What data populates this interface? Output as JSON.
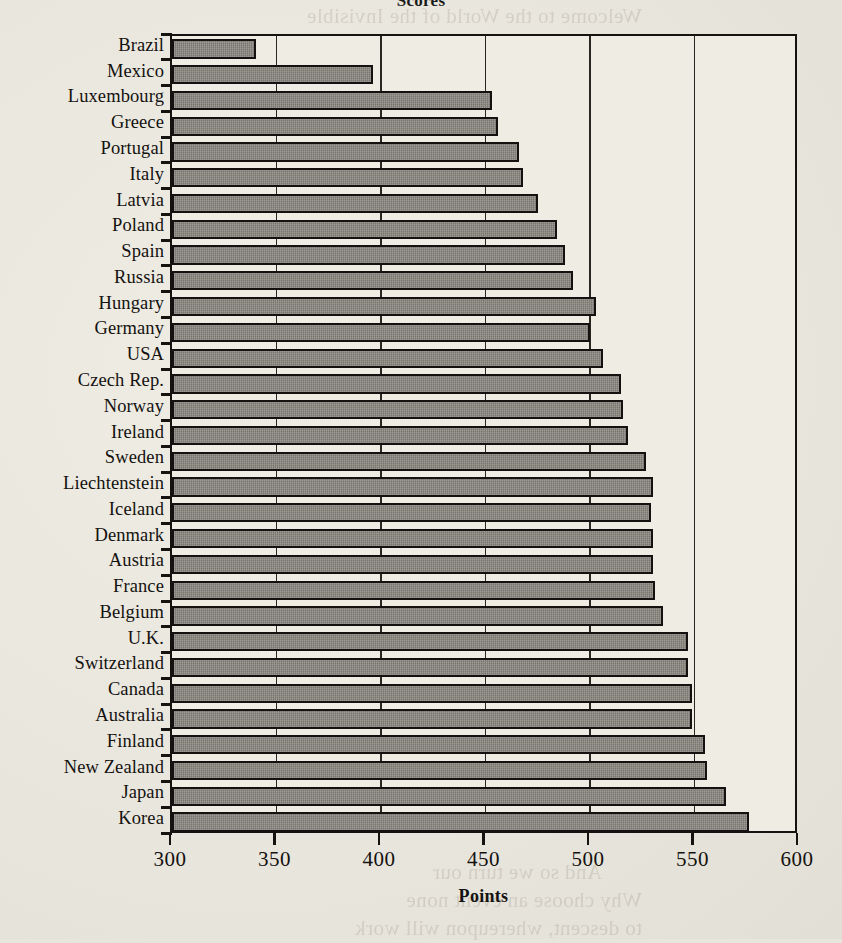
{
  "chart_data": {
    "type": "bar",
    "orientation": "horizontal",
    "title": "Scores",
    "xlabel": "Points",
    "ylabel": "",
    "xlim": [
      300,
      600
    ],
    "xticks": [
      300,
      350,
      400,
      450,
      500,
      550,
      600
    ],
    "grid": true,
    "grid_axis": "x",
    "legend": null,
    "bar_color": "#8a8780",
    "bar_edge_color": "#141210",
    "background_color": "#efece4",
    "categories": [
      "Brazil",
      "Mexico",
      "Luxembourg",
      "Greece",
      "Portugal",
      "Italy",
      "Latvia",
      "Poland",
      "Spain",
      "Russia",
      "Hungary",
      "Germany",
      "USA",
      "Czech Rep.",
      "Norway",
      "Ireland",
      "Sweden",
      "Liechtenstein",
      "Iceland",
      "Denmark",
      "Austria",
      "France",
      "Belgium",
      "U.K.",
      "Switzerland",
      "Canada",
      "Australia",
      "Finland",
      "New Zealand",
      "Japan",
      "Korea"
    ],
    "values": [
      340,
      396,
      453,
      456,
      466,
      468,
      475,
      484,
      488,
      492,
      503,
      500,
      506,
      515,
      516,
      518,
      527,
      530,
      529,
      530,
      530,
      531,
      535,
      547,
      547,
      549,
      549,
      555,
      556,
      565,
      576
    ],
    "series": [
      {
        "name": "Scores",
        "values": [
          340,
          396,
          453,
          456,
          466,
          468,
          475,
          484,
          488,
          492,
          503,
          500,
          506,
          515,
          516,
          518,
          527,
          530,
          529,
          530,
          530,
          531,
          535,
          547,
          547,
          549,
          549,
          555,
          556,
          565,
          576
        ]
      }
    ]
  },
  "bleed_through": [
    {
      "t": "Welcome to the World of the Invisible",
      "x": 200,
      "y": 2
    },
    {
      "t": "ourselves in the real",
      "x": 60,
      "y": 32
    },
    {
      "t": "problems to solve",
      "x": 70,
      "y": 62
    },
    {
      "t": "What you are",
      "x": 68,
      "y": 90
    },
    {
      "t": "Rather, can you take",
      "x": 66,
      "y": 118
    },
    {
      "t": "encounter in the world",
      "x": 60,
      "y": 146
    },
    {
      "t": "them to the problem at",
      "x": 58,
      "y": 174
    },
    {
      "t": "mean it is not important",
      "x": 56,
      "y": 202
    },
    {
      "t": "or that a student",
      "x": 62,
      "y": 230
    },
    {
      "t": "than a student who",
      "x": 58,
      "y": 258
    },
    {
      "t": "skills and knowledge",
      "x": 54,
      "y": 286
    },
    {
      "t": "to use in new and",
      "x": 56,
      "y": 314
    },
    {
      "t": "of the world we live",
      "x": 52,
      "y": 342
    },
    {
      "t": "to understand and",
      "x": 56,
      "y": 372
    },
    {
      "t": "what we know",
      "x": 60,
      "y": 402
    },
    {
      "t": "The results",
      "x": 64,
      "y": 432
    },
    {
      "t": "in the world",
      "x": 58,
      "y": 462
    },
    {
      "t": "experience",
      "x": 62,
      "y": 540
    },
    {
      "t": "of our own",
      "x": 64,
      "y": 596
    },
    {
      "t": "our children",
      "x": 58,
      "y": 624
    },
    {
      "t": "of the world",
      "x": 56,
      "y": 652
    },
    {
      "t": "in the years",
      "x": 60,
      "y": 680
    },
    {
      "t": "we must",
      "x": 64,
      "y": 708
    },
    {
      "t": "a better",
      "x": 62,
      "y": 736
    },
    {
      "t": "of the future",
      "x": 58,
      "y": 764
    },
    {
      "t": "And so we turn our",
      "x": 240,
      "y": 858
    },
    {
      "t": "Why choose an event none",
      "x": 200,
      "y": 886
    },
    {
      "t": "to descent, whereupon will work",
      "x": 200,
      "y": 914
    }
  ]
}
